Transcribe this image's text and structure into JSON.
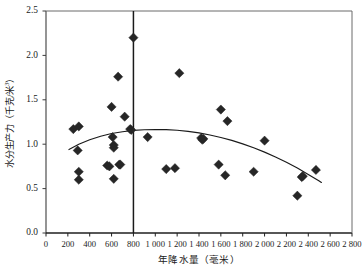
{
  "chart_data": {
    "type": "scatter",
    "title": "",
    "xlabel": "年降水量（毫米）",
    "ylabel": "水分生产力（千克/米³）",
    "ylabel_main": "水分生产力（千克/米",
    "ylabel_sup": "3",
    "ylabel_tail": "）",
    "xlim": [
      0,
      2800
    ],
    "ylim": [
      0.0,
      2.5
    ],
    "grid": false,
    "legend": null,
    "xticks": [
      0,
      200,
      400,
      600,
      800,
      1000,
      1200,
      1400,
      1600,
      1800,
      2000,
      2200,
      2400,
      2600,
      2800
    ],
    "xtick_labels": [
      "0",
      "200",
      "400",
      "600",
      "800",
      "1 000",
      "1 200",
      "1 400",
      "1 600",
      "1 800",
      "2 000",
      "2 200",
      "2 400",
      "2 600",
      "2 800"
    ],
    "yticks": [
      0.0,
      0.5,
      1.0,
      1.5,
      2.0,
      2.5
    ],
    "ytick_labels": [
      "0.0",
      "0.5",
      "1.0",
      "1.5",
      "2.0",
      "2.5"
    ],
    "marker": "diamond",
    "marker_color": "#262626",
    "marker_size": 4.6,
    "series": [
      {
        "name": "观测点",
        "points": [
          [
            250,
            1.17
          ],
          [
            300,
            1.2
          ],
          [
            290,
            0.93
          ],
          [
            300,
            0.69
          ],
          [
            300,
            0.6
          ],
          [
            560,
            0.76
          ],
          [
            580,
            0.75
          ],
          [
            600,
            1.42
          ],
          [
            610,
            1.08
          ],
          [
            620,
            0.99
          ],
          [
            620,
            0.96
          ],
          [
            620,
            0.61
          ],
          [
            660,
            1.76
          ],
          [
            670,
            0.77
          ],
          [
            680,
            0.77
          ],
          [
            720,
            1.31
          ],
          [
            770,
            1.17
          ],
          [
            780,
            1.16
          ],
          [
            800,
            2.2
          ],
          [
            930,
            1.08
          ],
          [
            1100,
            0.72
          ],
          [
            1180,
            0.73
          ],
          [
            1220,
            1.8
          ],
          [
            1420,
            1.07
          ],
          [
            1430,
            1.05
          ],
          [
            1440,
            1.06
          ],
          [
            1580,
            0.77
          ],
          [
            1600,
            1.39
          ],
          [
            1640,
            0.65
          ],
          [
            1660,
            1.26
          ],
          [
            1900,
            0.69
          ],
          [
            2000,
            1.04
          ],
          [
            2300,
            0.42
          ],
          [
            2340,
            0.63
          ],
          [
            2350,
            0.64
          ],
          [
            2470,
            0.71
          ]
        ]
      }
    ],
    "trendline": {
      "name": "二次拟合曲线",
      "type": "quadratic",
      "color": "#1a1a1a",
      "x_start": 210,
      "x_end": 2520,
      "points": [
        [
          210,
          0.94
        ],
        [
          300,
          1.0
        ],
        [
          400,
          1.05
        ],
        [
          500,
          1.09
        ],
        [
          600,
          1.12
        ],
        [
          700,
          1.14
        ],
        [
          800,
          1.155
        ],
        [
          900,
          1.163
        ],
        [
          1000,
          1.166
        ],
        [
          1100,
          1.164
        ],
        [
          1200,
          1.157
        ],
        [
          1300,
          1.145
        ],
        [
          1400,
          1.127
        ],
        [
          1500,
          1.104
        ],
        [
          1600,
          1.076
        ],
        [
          1700,
          1.043
        ],
        [
          1800,
          1.004
        ],
        [
          1900,
          0.96
        ],
        [
          2000,
          0.911
        ],
        [
          2100,
          0.856
        ],
        [
          2200,
          0.796
        ],
        [
          2300,
          0.731
        ],
        [
          2400,
          0.66
        ],
        [
          2500,
          0.585
        ],
        [
          2520,
          0.569
        ]
      ]
    },
    "reference_line": {
      "name": "800毫米等降水量线",
      "orientation": "vertical",
      "x": 800,
      "color": "#1a1a1a"
    }
  }
}
